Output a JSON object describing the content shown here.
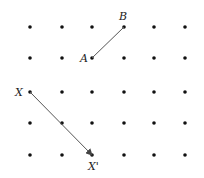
{
  "diagram": {
    "type": "dot-grid-translation",
    "grid": {
      "rows": 5,
      "cols": 6,
      "x": [
        30,
        62,
        92,
        124,
        154,
        185
      ],
      "y": [
        27,
        58,
        92,
        123,
        155
      ],
      "dot_color": "#111111"
    },
    "segments": [
      {
        "id": "AB",
        "from": "A",
        "to": "B",
        "arrow": false,
        "color": "#555555"
      },
      {
        "id": "XX'",
        "from": "X",
        "to": "X'",
        "arrow": true,
        "color": "#555555"
      }
    ],
    "points": {
      "A": {
        "label": "A",
        "x": 92,
        "y": 58,
        "label_x": 80,
        "label_y": 62
      },
      "B": {
        "label": "B",
        "x": 124,
        "y": 27,
        "label_x": 119,
        "label_y": 20
      },
      "X": {
        "label": "X",
        "x": 30,
        "y": 92,
        "label_x": 15,
        "label_y": 96
      },
      "X'": {
        "label": "X'",
        "x": 92,
        "y": 155,
        "label_x": 88,
        "label_y": 170
      }
    }
  }
}
